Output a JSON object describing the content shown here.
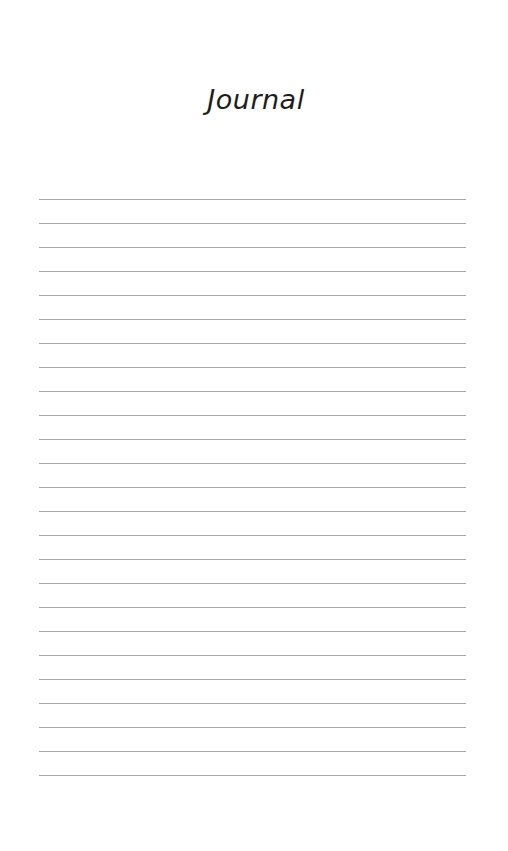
{
  "page": {
    "title": "Journal",
    "background_color": "#ffffff",
    "text_color": "#1e1e1e"
  },
  "ruled_lines": {
    "count": 25,
    "first_line_y": 199,
    "spacing_px": 24,
    "left_x": 39,
    "right_x": 466,
    "color": "#a8a8a8"
  }
}
